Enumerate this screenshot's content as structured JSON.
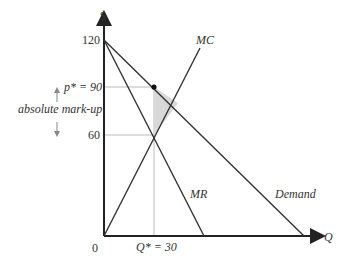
{
  "diagram": {
    "type": "monopoly markup diagram",
    "y_axis_label": "$",
    "x_axis_label": "Q",
    "y_ticks": [
      {
        "label": "120",
        "value": 120
      },
      {
        "label": "60",
        "value": 60
      }
    ],
    "price_label": "p* = 90",
    "quantity_label": "Q* = 30",
    "origin_label": "0",
    "markup_label": "absolute mark-up",
    "curves": [
      {
        "name": "Demand",
        "label": "Demand",
        "from": [
          0,
          120
        ],
        "to": [
          120,
          0
        ]
      },
      {
        "name": "MR",
        "label": "MR",
        "from": [
          0,
          120
        ],
        "to": [
          60,
          0
        ]
      },
      {
        "name": "MC",
        "label": "MC",
        "from": [
          0,
          0
        ],
        "to": [
          45,
          90
        ]
      }
    ],
    "optimum": {
      "q": 30,
      "p": 90,
      "mc": 60
    },
    "colors": {
      "lines": "#333333",
      "guides": "#bbbbbb",
      "shade": "#d8d8d8"
    }
  }
}
